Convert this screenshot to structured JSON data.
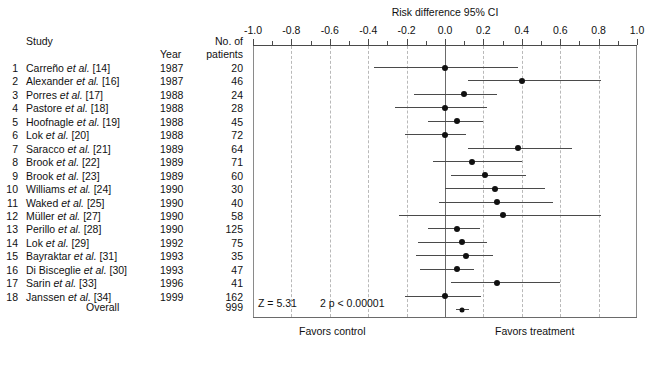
{
  "figure": {
    "plot_title": "Risk difference 95% CI",
    "favors_left": "Favors control",
    "favors_right": "Favors treatment",
    "z_label": "Z = 5.31",
    "p_label": "2 p < 0.00001"
  },
  "columns": {
    "study": "Study",
    "year": "Year",
    "n_line1": "No. of",
    "n_line2": "patients",
    "overall": "Overall"
  },
  "chart_data": {
    "type": "forest",
    "title": "Risk difference 95% CI",
    "xlabel": "Risk difference 95% CI",
    "ylabel": "",
    "xlim": [
      -1.0,
      1.0
    ],
    "xticks": [
      -1.0,
      -0.8,
      -0.6,
      -0.4,
      -0.2,
      0.0,
      0.2,
      0.4,
      0.6,
      0.8,
      1.0
    ],
    "xticklabels": [
      "-1.0",
      "-0.8",
      "-0.6",
      "-0.4",
      "-0.2",
      "0.0",
      "0.2",
      "0.4",
      "0.6",
      "0.8",
      "1.0"
    ],
    "grid": true,
    "grid_style": "dashed",
    "null_line": 0.0,
    "legend": "none",
    "annotations": [
      "Z = 5.31",
      "2 p < 0.00001",
      "Favors control",
      "Favors treatment"
    ],
    "total_patients": 999,
    "rows": [
      {
        "idx": "1",
        "study": "Carreño",
        "suffix": "[14]",
        "year": "1987",
        "n": "20",
        "estimate": 0.0,
        "lower": -0.37,
        "upper": 0.38
      },
      {
        "idx": "2",
        "study": "Alexander",
        "suffix": "[16]",
        "year": "1987",
        "n": "46",
        "estimate": 0.4,
        "lower": 0.12,
        "upper": 0.81
      },
      {
        "idx": "3",
        "study": "Porres",
        "suffix": "[17]",
        "year": "1988",
        "n": "24",
        "estimate": 0.1,
        "lower": -0.16,
        "upper": 0.27
      },
      {
        "idx": "4",
        "study": "Pastore",
        "suffix": "[18]",
        "year": "1988",
        "n": "28",
        "estimate": 0.0,
        "lower": -0.26,
        "upper": 0.22
      },
      {
        "idx": "5",
        "study": "Hoofnagle",
        "suffix": "[19]",
        "year": "1988",
        "n": "45",
        "estimate": 0.06,
        "lower": -0.09,
        "upper": 0.2
      },
      {
        "idx": "6",
        "study": "Lok",
        "suffix": "[20]",
        "year": "1988",
        "n": "72",
        "estimate": 0.0,
        "lower": -0.21,
        "upper": 0.11
      },
      {
        "idx": "7",
        "study": "Saracco",
        "suffix": "[21]",
        "year": "1989",
        "n": "64",
        "estimate": 0.38,
        "lower": 0.12,
        "upper": 0.66
      },
      {
        "idx": "8",
        "study": "Brook",
        "suffix": "[22]",
        "year": "1989",
        "n": "71",
        "estimate": 0.14,
        "lower": -0.06,
        "upper": 0.4
      },
      {
        "idx": "9",
        "study": "Brook",
        "suffix": "[23]",
        "year": "1989",
        "n": "60",
        "estimate": 0.21,
        "lower": 0.03,
        "upper": 0.42
      },
      {
        "idx": "10",
        "study": "Williams",
        "suffix": "[24]",
        "year": "1990",
        "n": "30",
        "estimate": 0.26,
        "lower": 0.0,
        "upper": 0.52
      },
      {
        "idx": "11",
        "study": "Waked",
        "suffix": "[25]",
        "year": "1990",
        "n": "40",
        "estimate": 0.27,
        "lower": -0.03,
        "upper": 0.56
      },
      {
        "idx": "12",
        "study": "Müller",
        "suffix": "[27]",
        "year": "1990",
        "n": "58",
        "estimate": 0.3,
        "lower": -0.24,
        "upper": 0.81
      },
      {
        "idx": "13",
        "study": "Perillo",
        "suffix": "[28]",
        "year": "1990",
        "n": "125",
        "estimate": 0.06,
        "lower": -0.09,
        "upper": 0.18
      },
      {
        "idx": "14",
        "study": "Lok",
        "suffix": "[29]",
        "year": "1992",
        "n": "75",
        "estimate": 0.09,
        "lower": -0.14,
        "upper": 0.22
      },
      {
        "idx": "15",
        "study": "Bayraktar",
        "suffix": "[31]",
        "year": "1993",
        "n": "35",
        "estimate": 0.11,
        "lower": -0.15,
        "upper": 0.25
      },
      {
        "idx": "16",
        "study": "Di Bisceglie",
        "suffix": "[30]",
        "year": "1993",
        "n": "47",
        "estimate": 0.06,
        "lower": -0.13,
        "upper": 0.15
      },
      {
        "idx": "17",
        "study": "Sarin",
        "suffix": "[33]",
        "year": "1996",
        "n": "41",
        "estimate": 0.27,
        "lower": 0.03,
        "upper": 0.6
      },
      {
        "idx": "18",
        "study": "Janssen",
        "suffix": "[34]",
        "year": "1999",
        "n": "162",
        "estimate": 0.0,
        "lower": -0.21,
        "upper": 0.19
      }
    ],
    "overall": {
      "label": "Overall",
      "n": "999",
      "estimate": 0.09,
      "lower": 0.055,
      "upper": 0.125
    }
  }
}
